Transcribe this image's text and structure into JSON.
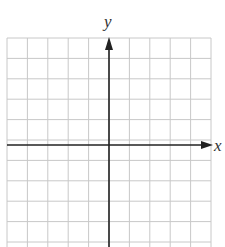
{
  "diagram": {
    "type": "coordinate-grid",
    "x_axis_label": "x",
    "y_axis_label": "y",
    "grid": {
      "columns": 10,
      "rows_visible": 10,
      "left": 7,
      "top": 38,
      "cell": 20.4,
      "line_color": "#c8c8c8"
    },
    "axes": {
      "origin_x": 109,
      "origin_y": 145,
      "color": "#222222"
    }
  }
}
